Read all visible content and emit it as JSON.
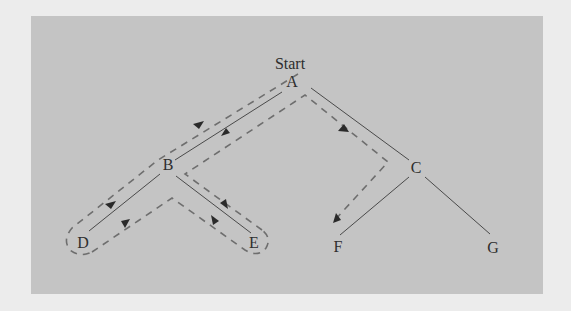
{
  "diagram": {
    "type": "tree-traversal",
    "start_label": "Start",
    "nodes": [
      {
        "id": "A",
        "label": "A",
        "x": 292,
        "y": 82
      },
      {
        "id": "B",
        "label": "B",
        "x": 168,
        "y": 165
      },
      {
        "id": "C",
        "label": "C",
        "x": 416,
        "y": 168
      },
      {
        "id": "D",
        "label": "D",
        "x": 83,
        "y": 243
      },
      {
        "id": "E",
        "label": "E",
        "x": 254,
        "y": 243
      },
      {
        "id": "F",
        "label": "F",
        "x": 338,
        "y": 247
      },
      {
        "id": "G",
        "label": "G",
        "x": 493,
        "y": 248
      }
    ],
    "edges": [
      {
        "from": "A",
        "to": "B"
      },
      {
        "from": "A",
        "to": "C"
      },
      {
        "from": "B",
        "to": "D"
      },
      {
        "from": "B",
        "to": "E"
      },
      {
        "from": "C",
        "to": "F"
      },
      {
        "from": "C",
        "to": "G"
      }
    ],
    "traversal_order": [
      "A",
      "B",
      "D",
      "B",
      "E",
      "B",
      "A",
      "C",
      "F"
    ],
    "colors": {
      "background": "#ececec",
      "panel": "#c4c4c4",
      "edge": "#4a4a4a",
      "traversal_dash": "#6e6e6e",
      "arrow": "#2a2a2a",
      "text": "#2e2e2e"
    }
  }
}
